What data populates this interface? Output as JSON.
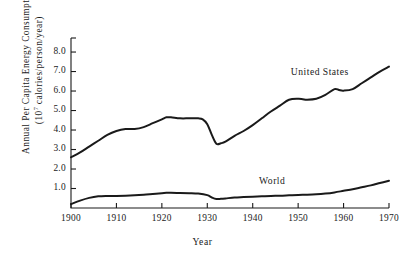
{
  "chart_data": {
    "type": "line",
    "title": "",
    "xlabel": "Year",
    "ylabel_line1": "Annual Per Capita Energy Consumption",
    "ylabel_line2_prefix": "(10",
    "ylabel_line2_exponent": "7",
    "ylabel_line2_suffix": " calories/person/year)",
    "ylabel_full": "Annual Per Capita Energy Consumption (10^7 calories/person/year)",
    "xlim": [
      1900,
      1970
    ],
    "ylim": [
      0.0,
      8.0
    ],
    "grid": false,
    "legend_position": "inline-annotation",
    "x_ticks": [
      1900,
      1910,
      1920,
      1930,
      1940,
      1950,
      1960,
      1970
    ],
    "x_tick_labels": [
      "1900",
      "1910",
      "1920",
      "1930",
      "1940",
      "1950",
      "1960",
      "1970"
    ],
    "y_ticks": [
      1.0,
      2.0,
      3.0,
      4.0,
      5.0,
      6.0,
      7.0,
      8.0
    ],
    "y_tick_labels": [
      "1.0",
      "2.0",
      "3.0",
      "4.0",
      "5.0",
      "6.0",
      "7.0",
      "8.0"
    ],
    "line_color": "#1a1a1a",
    "background_color": "#ffffff",
    "series": [
      {
        "name": "United States",
        "label": "United States",
        "label_x": 1955,
        "label_y": 6.9,
        "x": [
          1900,
          1902,
          1904,
          1906,
          1908,
          1910,
          1912,
          1914,
          1916,
          1918,
          1920,
          1921,
          1922,
          1924,
          1926,
          1928,
          1929,
          1930,
          1931,
          1932,
          1933,
          1934,
          1936,
          1938,
          1940,
          1942,
          1944,
          1946,
          1948,
          1950,
          1951,
          1952,
          1954,
          1956,
          1958,
          1959,
          1960,
          1962,
          1964,
          1966,
          1968,
          1970
        ],
        "y": [
          2.6,
          2.85,
          3.15,
          3.45,
          3.75,
          3.95,
          4.05,
          4.05,
          4.15,
          4.35,
          4.55,
          4.65,
          4.65,
          4.6,
          4.6,
          4.6,
          4.55,
          4.3,
          3.75,
          3.3,
          3.32,
          3.4,
          3.7,
          3.95,
          4.25,
          4.6,
          4.95,
          5.25,
          5.55,
          5.6,
          5.58,
          5.55,
          5.6,
          5.8,
          6.1,
          6.05,
          6.02,
          6.1,
          6.4,
          6.7,
          7.0,
          7.25
        ]
      },
      {
        "name": "World",
        "label": "World",
        "label_x": 1948,
        "label_y": 1.35,
        "x": [
          1900,
          1902,
          1904,
          1906,
          1908,
          1910,
          1912,
          1914,
          1916,
          1918,
          1920,
          1921,
          1922,
          1924,
          1926,
          1928,
          1930,
          1931,
          1932,
          1933,
          1934,
          1936,
          1938,
          1940,
          1942,
          1944,
          1946,
          1948,
          1950,
          1952,
          1954,
          1956,
          1958,
          1960,
          1962,
          1964,
          1966,
          1968,
          1970
        ],
        "y": [
          0.2,
          0.38,
          0.52,
          0.6,
          0.62,
          0.62,
          0.63,
          0.65,
          0.68,
          0.72,
          0.76,
          0.78,
          0.78,
          0.77,
          0.76,
          0.74,
          0.66,
          0.54,
          0.46,
          0.47,
          0.49,
          0.54,
          0.56,
          0.58,
          0.6,
          0.62,
          0.63,
          0.65,
          0.67,
          0.68,
          0.7,
          0.74,
          0.8,
          0.88,
          0.96,
          1.06,
          1.16,
          1.28,
          1.4
        ]
      }
    ]
  },
  "geometry": {
    "plot_left": 71,
    "plot_right": 389,
    "plot_top": 38,
    "plot_bottom": 208,
    "y_axis_value_at_bottom": 0.0,
    "y_axis_value_at_top": 8.72
  }
}
